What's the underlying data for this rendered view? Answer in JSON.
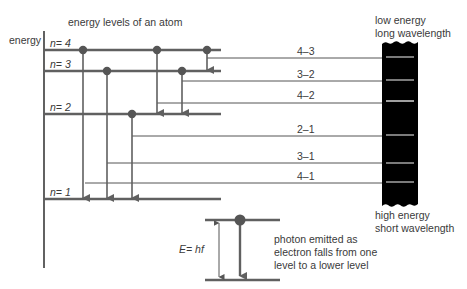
{
  "title": "energy levels of an atom",
  "axis_label": "energy",
  "levels": [
    {
      "n": "4",
      "label": "n = 4",
      "y": 50
    },
    {
      "n": "3",
      "label": "n = 3",
      "y": 71
    },
    {
      "n": "2",
      "label": "n = 2",
      "y": 114
    },
    {
      "n": "1",
      "label": "n = 1",
      "y": 199
    }
  ],
  "level_labels": {
    "n4": "n= 4",
    "n3": "n= 3",
    "n2": "n= 2",
    "n1": "n= 1"
  },
  "transitions": [
    {
      "label": "4–3",
      "from": 4,
      "to": 3
    },
    {
      "label": "3–2",
      "from": 3,
      "to": 2
    },
    {
      "label": "4–2",
      "from": 4,
      "to": 2
    },
    {
      "label": "2–1",
      "from": 2,
      "to": 1
    },
    {
      "label": "3–1",
      "from": 3,
      "to": 1
    },
    {
      "label": "4–1",
      "from": 4,
      "to": 1
    }
  ],
  "spectrum": {
    "top_label_1": "low energy",
    "top_label_2": "long wavelength",
    "bottom_label_1": "high energy",
    "bottom_label_2": "short wavelength",
    "background": "#000000",
    "line_color": "#9a9a9a"
  },
  "inset": {
    "equation": "E= hf",
    "caption_1": "photon emitted as",
    "caption_2": "electron falls from one",
    "caption_3": "level to a lower level"
  },
  "colors": {
    "level_line": "#606060",
    "thin_line": "#555555",
    "text": "#3a3a3a"
  }
}
